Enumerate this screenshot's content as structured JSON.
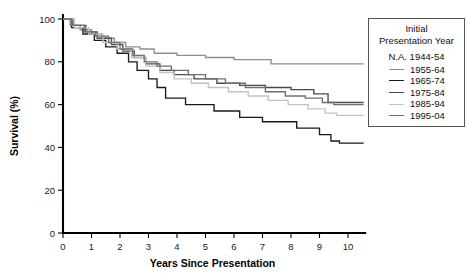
{
  "chart_data": {
    "type": "line",
    "subtype": "kaplan-meier-survival-step",
    "title": "",
    "xlabel": "Years Since Presentation",
    "ylabel": "Survival (%)",
    "xlim": [
      0,
      10.6
    ],
    "ylim": [
      0,
      100
    ],
    "xticks": [
      "0",
      "1",
      "2",
      "3",
      "4",
      "5",
      "6",
      "7",
      "8",
      "9",
      "10"
    ],
    "yticks": [
      "0",
      "20",
      "40",
      "60",
      "80",
      "100"
    ],
    "grid": false,
    "legend_position": "right-top",
    "legend_title_line1": "Initial",
    "legend_title_line2": "Presentation Year",
    "legend_na_entry": "N.A. 1944-54",
    "series": [
      {
        "name": "1955-64",
        "color": "#8e8e8e",
        "width": 1.3,
        "final_value": 79,
        "points": [
          [
            0.0,
            100
          ],
          [
            0.25,
            97
          ],
          [
            0.6,
            95
          ],
          [
            1.0,
            93
          ],
          [
            1.35,
            91
          ],
          [
            1.8,
            89
          ],
          [
            2.2,
            87
          ],
          [
            2.7,
            86
          ],
          [
            3.2,
            84
          ],
          [
            4.0,
            83
          ],
          [
            5.0,
            82
          ],
          [
            6.0,
            81
          ],
          [
            7.3,
            79
          ],
          [
            10.55,
            79
          ]
        ]
      },
      {
        "name": "1965-74",
        "color": "#1a1a1a",
        "width": 1.45,
        "final_value": 42,
        "points": [
          [
            0.0,
            100
          ],
          [
            0.3,
            96
          ],
          [
            0.7,
            93
          ],
          [
            1.1,
            90
          ],
          [
            1.5,
            87
          ],
          [
            1.9,
            84
          ],
          [
            2.3,
            80
          ],
          [
            2.6,
            76
          ],
          [
            3.0,
            72
          ],
          [
            3.3,
            68
          ],
          [
            3.6,
            63
          ],
          [
            4.3,
            60
          ],
          [
            5.3,
            57
          ],
          [
            6.2,
            54
          ],
          [
            7.0,
            52
          ],
          [
            8.2,
            49
          ],
          [
            9.0,
            46
          ],
          [
            9.4,
            43
          ],
          [
            9.7,
            42
          ],
          [
            10.55,
            42
          ]
        ]
      },
      {
        "name": "1975-84",
        "color": "#4a4a4a",
        "width": 1.4,
        "final_value": 61,
        "points": [
          [
            0.0,
            100
          ],
          [
            0.35,
            97
          ],
          [
            0.8,
            94
          ],
          [
            1.2,
            91
          ],
          [
            1.7,
            88
          ],
          [
            2.1,
            85
          ],
          [
            2.5,
            82
          ],
          [
            2.9,
            79
          ],
          [
            3.4,
            76
          ],
          [
            3.9,
            74
          ],
          [
            4.6,
            72
          ],
          [
            5.4,
            70
          ],
          [
            6.2,
            69
          ],
          [
            7.1,
            68
          ],
          [
            8.0,
            67
          ],
          [
            8.8,
            65
          ],
          [
            9.3,
            61
          ],
          [
            10.55,
            61
          ]
        ]
      },
      {
        "name": "1985-94",
        "color": "#c2c2c2",
        "width": 1.3,
        "final_value": 55,
        "points": [
          [
            0.0,
            100
          ],
          [
            0.4,
            96
          ],
          [
            0.9,
            93
          ],
          [
            1.4,
            89
          ],
          [
            1.9,
            86
          ],
          [
            2.4,
            82
          ],
          [
            2.9,
            78
          ],
          [
            3.4,
            75
          ],
          [
            3.9,
            72
          ],
          [
            4.5,
            70
          ],
          [
            5.1,
            68
          ],
          [
            5.8,
            66
          ],
          [
            6.5,
            64
          ],
          [
            7.2,
            62
          ],
          [
            7.9,
            60
          ],
          [
            8.6,
            58
          ],
          [
            9.2,
            56
          ],
          [
            9.6,
            55
          ],
          [
            10.55,
            55
          ]
        ]
      },
      {
        "name": "1995-04",
        "color": "#707070",
        "width": 1.35,
        "final_value": 60,
        "points": [
          [
            0.0,
            100
          ],
          [
            0.3,
            97
          ],
          [
            0.75,
            94
          ],
          [
            1.15,
            92
          ],
          [
            1.6,
            89
          ],
          [
            2.0,
            86
          ],
          [
            2.45,
            83
          ],
          [
            2.85,
            80
          ],
          [
            3.3,
            78
          ],
          [
            3.8,
            76
          ],
          [
            4.4,
            74
          ],
          [
            5.0,
            72
          ],
          [
            5.7,
            70
          ],
          [
            6.4,
            68
          ],
          [
            7.1,
            66
          ],
          [
            7.8,
            64
          ],
          [
            8.5,
            63
          ],
          [
            9.1,
            61
          ],
          [
            9.5,
            60
          ],
          [
            10.55,
            60
          ]
        ]
      }
    ]
  }
}
